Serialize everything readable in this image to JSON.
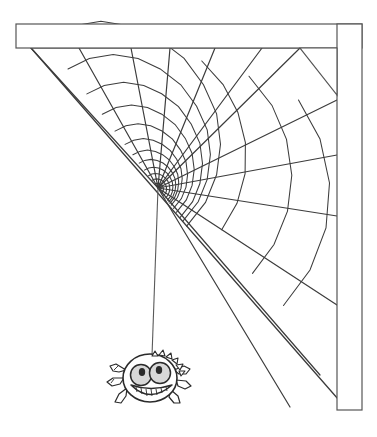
{
  "illustration": {
    "title": "Spider hanging from corner spider web",
    "background_color": "#ffffff",
    "line_color": "#3a3a3a",
    "width": 377,
    "height": 437
  },
  "corner_frame": {
    "name": "wall-corner-molding",
    "stroke_color": "#555555",
    "fill_color": "#ffffff",
    "horizontal_beam": {
      "label": "horizontal ceiling beam",
      "x": 16,
      "y": 24,
      "width": 346,
      "height": 24
    },
    "vertical_beam": {
      "label": "vertical wall beam",
      "x": 337,
      "y": 24,
      "width": 25,
      "height": 386
    },
    "corner_bracket": {
      "label": "triangular corner bracket",
      "points": "300,48 337,48 337,95"
    }
  },
  "web": {
    "name": "spider-web",
    "hub_x": 158,
    "hub_y": 188,
    "stroke_color": "#3c3c3c",
    "radial_count": 13,
    "spiral_ring_count": 14,
    "anchors_top": [
      31,
      79,
      131,
      170,
      215,
      262,
      300
    ],
    "anchors_right": [
      155,
      216,
      305,
      360
    ],
    "outer_edge_label": "outer web frame thread"
  },
  "dragline": {
    "name": "spider-dragline-thread",
    "from_x": 158,
    "from_y": 188,
    "to_x": 158,
    "to_y": 356,
    "stroke_color": "#5a5a5a"
  },
  "spider": {
    "name": "cartoon-spider",
    "body_center_x": 150,
    "body_center_y": 378,
    "body_radius_x": 27,
    "body_radius_y": 24,
    "outline_color": "#2b2b2b",
    "body_fill": "#ffffff",
    "eye_fill": "#d8d8d8",
    "pupil_fill": "#2b2b2b",
    "left_leg_count": 3,
    "right_leg_count": 3,
    "spike_count": 6,
    "expression": "grinning",
    "tooth_count": 7
  }
}
